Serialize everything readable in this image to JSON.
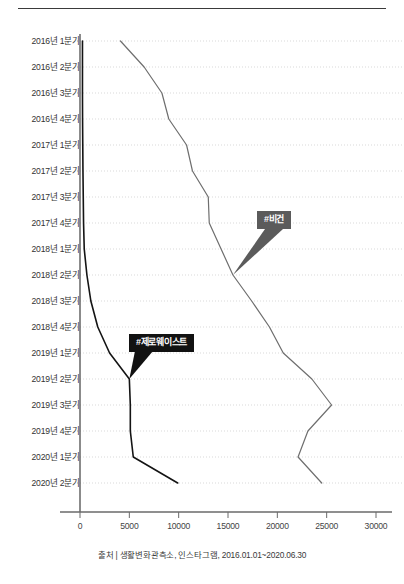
{
  "header": {
    "rule": true
  },
  "footer": {
    "source": "출처 | 생활변화관측소, 인스타그램, 2016.01.01~2020.06.30"
  },
  "annotations": [
    {
      "id": "vegan-callout",
      "label": "#비건",
      "color": "#5b5b5b",
      "x": 16000,
      "y_category": "2018년 2분기"
    },
    {
      "id": "zerowaste-callout",
      "label": "#제로웨이스트",
      "color": "#121212",
      "x": 5200,
      "y_category": "2019년 2분기"
    }
  ],
  "chart_data": {
    "type": "line",
    "orientation": "horizontal",
    "title": "",
    "subtitle": "",
    "xlabel": "",
    "ylabel": "",
    "xlim": [
      0,
      30000
    ],
    "xticks": [
      0,
      5000,
      10000,
      15000,
      20000,
      25000,
      30000
    ],
    "xticklabels": [
      "0",
      "5000",
      "10000",
      "15000",
      "20000",
      "25000",
      "30000"
    ],
    "grid": true,
    "grid_style": "dotted-horizontal",
    "legend": "annotated-callouts",
    "categories": [
      "2016년 1분기",
      "2016년 2분기",
      "2016년 3분기",
      "2016년 4분기",
      "2017년 1분기",
      "2017년 2분기",
      "2017년 3분기",
      "2017년 4분기",
      "2018년 1분기",
      "2018년 2분기",
      "2018년 3분기",
      "2018년 4분기",
      "2019년 1분기",
      "2019년 2분기",
      "2019년 3분기",
      "2019년 4분기",
      "2020년 1분기",
      "2020년 2분기"
    ],
    "series": [
      {
        "name": "#비건",
        "color": "#6e6e6e",
        "width": 1.2,
        "values": [
          4100,
          6500,
          8300,
          9000,
          10800,
          11400,
          13000,
          13100,
          14300,
          15500,
          17400,
          19200,
          20600,
          23500,
          25500,
          23100,
          22100,
          24500
        ]
      },
      {
        "name": "#제로웨이스트",
        "color": "#141414",
        "width": 1.6,
        "values": [
          250,
          250,
          250,
          260,
          280,
          300,
          330,
          360,
          430,
          700,
          1100,
          1800,
          3000,
          5000,
          5100,
          5100,
          5400,
          9900
        ]
      }
    ]
  }
}
